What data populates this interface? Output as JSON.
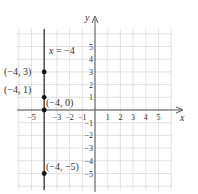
{
  "chart_data": {
    "type": "scatter",
    "title": "",
    "xlabel": "x",
    "ylabel": "y",
    "xlim": [
      -6,
      6
    ],
    "ylim": [
      -6,
      6
    ],
    "grid": true,
    "x_ticks": [
      -5,
      -3,
      -2,
      -1,
      1,
      2,
      3,
      4,
      5
    ],
    "y_ticks": [
      5,
      4,
      3,
      2,
      1,
      -1,
      -2,
      -3,
      -4,
      -5
    ],
    "x_tick_labels": [
      "−5",
      "−3",
      "−2",
      "−1",
      "1",
      "2",
      "3",
      "4",
      "5"
    ],
    "y_tick_labels": [
      "5",
      "4",
      "3",
      "2",
      "1",
      "−1",
      "−2",
      "−3",
      "−4",
      "−5"
    ],
    "vertical_line": {
      "x": -4,
      "label": "x = −4"
    },
    "points": [
      {
        "x": -4,
        "y": 3,
        "label": "(−4, 3)"
      },
      {
        "x": -4,
        "y": 1,
        "label": "(−4, 1)"
      },
      {
        "x": -4,
        "y": 0,
        "label": "(−4, 0)"
      },
      {
        "x": -4,
        "y": -5,
        "label": "(−4, −5)"
      }
    ]
  },
  "colors": {
    "grid": "#d9d9d9",
    "axis": "#555555",
    "line": "#333333",
    "point": "#111111",
    "text": "#333333"
  }
}
